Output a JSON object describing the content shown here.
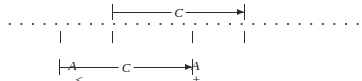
{
  "figure": {
    "background_color": "#ffffff",
    "ink_color": "#2b2b2b",
    "dot_color": "#4a4a4a",
    "width": 362,
    "height": 81
  },
  "number_line": {
    "name": "dotted-number-line",
    "style": "dotted",
    "dot_spacing_px": 11.6
  },
  "measures": {
    "top": {
      "label": "C",
      "from_tick": "B",
      "to_tick": "B + C",
      "direction": "right"
    },
    "bottom": {
      "label": "C",
      "from_tick": "A",
      "to_tick": "A + C",
      "direction": "right"
    }
  },
  "ticks": [
    {
      "id": "A",
      "label": "A"
    },
    {
      "id": "B",
      "label": "B"
    },
    {
      "id": "A+C",
      "label": "A + C"
    },
    {
      "id": "B+C",
      "label": "B + C"
    }
  ],
  "expressions": {
    "left": {
      "lhs": "A",
      "operator": "<",
      "rhs": "B",
      "full": "A  <  B"
    },
    "right": {
      "lhs_term1": "A",
      "plus": "+",
      "lhs_term2": "C",
      "operator": "<",
      "rhs_term1": "B",
      "rhs_term2": "C",
      "full": "A + C < B + C"
    }
  }
}
